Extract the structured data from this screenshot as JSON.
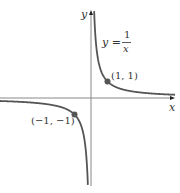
{
  "chart_data": {
    "type": "line",
    "title": "",
    "function": "y = 1/x",
    "xlabel": "x",
    "ylabel": "y",
    "equation_label": {
      "lhs": "y =",
      "numerator": "1",
      "denominator": "x"
    },
    "points": [
      {
        "x": 1,
        "y": 1,
        "label": "(1, 1)"
      },
      {
        "x": -1,
        "y": -1,
        "label": "(−1, −1)"
      }
    ],
    "xlim": [
      -5.5,
      5
    ],
    "ylim": [
      -5.3,
      5.3
    ],
    "grid": false,
    "colors": {
      "curve": "#555555",
      "axis": "#777777",
      "point": "#555555"
    }
  }
}
